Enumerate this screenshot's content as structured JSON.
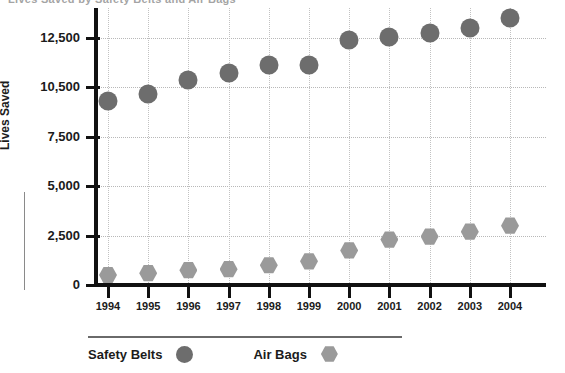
{
  "title_sliver": "Lives Saved by Safety Belts and Air Bags",
  "colors": {
    "safety_belts": "#6d6d6d",
    "air_bags": "#9a9a9a",
    "axis": "#111111",
    "gridline": "#b8b8b8"
  },
  "legend": {
    "items": [
      {
        "label": "Safety Belts",
        "marker": "circle-marker-icon"
      },
      {
        "label": "Air Bags",
        "marker": "hexagon-marker-icon"
      }
    ]
  },
  "chart_data": {
    "type": "scatter",
    "title": "",
    "xlabel": "",
    "ylabel": "Lives Saved",
    "grid": true,
    "legend_position": "bottom",
    "categories": [
      "1994",
      "1995",
      "1996",
      "1997",
      "1998",
      "1999",
      "2000",
      "2001",
      "2002",
      "2003",
      "2004"
    ],
    "x_tick_labels": [
      "1994",
      "1995",
      "1996",
      "1997",
      "1998",
      "1999",
      "2000",
      "2001",
      "2002",
      "2003",
      "2004"
    ],
    "y_tick_labels": [
      "0",
      "2,500",
      "5,000",
      "7,500",
      "10,500",
      "12,500"
    ],
    "y_tick_values": [
      0,
      2500,
      5000,
      7500,
      10500,
      12500
    ],
    "y_axis_note": "tick labels are non-uniform: ticks are evenly spaced but 10,500 replaces 10,000",
    "ylim": [
      0,
      13750
    ],
    "series": [
      {
        "name": "Safety Belts",
        "marker": "circle",
        "color": "#6d6d6d",
        "values": [
          9650,
          10100,
          10800,
          11100,
          11400,
          11400,
          12400,
          12550,
          12700,
          12900,
          13300
        ]
      },
      {
        "name": "Air Bags",
        "marker": "hexagon",
        "color": "#9a9a9a",
        "values": [
          500,
          600,
          750,
          800,
          1000,
          1200,
          1750,
          2300,
          2450,
          2700,
          3000
        ]
      }
    ]
  }
}
